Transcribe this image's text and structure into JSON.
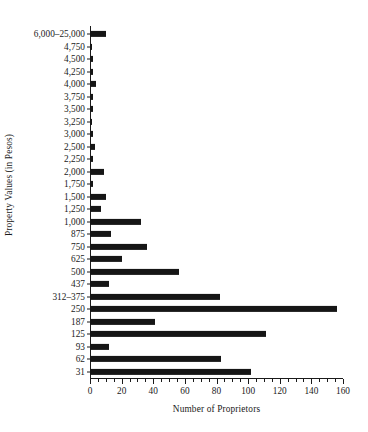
{
  "chart_data": {
    "type": "bar",
    "orientation": "horizontal",
    "title": "",
    "xlabel": "Number of Proprietors",
    "ylabel": "Property Values (in Pesos)",
    "xlim": [
      0,
      160
    ],
    "ylim": null,
    "grid": false,
    "legend": null,
    "xticks": [
      0,
      20,
      40,
      60,
      80,
      100,
      120,
      140,
      160
    ],
    "xtick_labels": [
      "0",
      "20",
      "40",
      "60",
      "80",
      "100",
      "120",
      "140",
      "160"
    ],
    "xtick_minor_step": 5,
    "bar_color": "#161616",
    "categories": [
      "6,000–25,000",
      "4,750",
      "4,500",
      "4,250",
      "4,000",
      "3,750",
      "3,500",
      "3,250",
      "3,000",
      "2,500",
      "2,250",
      "2,000",
      "1,750",
      "1,500",
      "1,250",
      "1,000",
      "875",
      "750",
      "625",
      "500",
      "437",
      "312–375",
      "250",
      "187",
      "125",
      "93",
      "62",
      "31"
    ],
    "values": [
      10,
      1,
      2,
      2,
      4,
      2,
      2,
      1,
      2,
      3,
      2,
      9,
      2,
      10,
      7,
      32,
      13,
      36,
      20,
      56,
      12,
      82,
      156,
      41,
      111,
      12,
      83,
      102
    ]
  }
}
